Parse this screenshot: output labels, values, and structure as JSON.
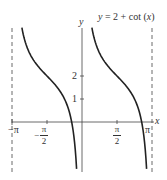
{
  "chart_data": {
    "type": "line",
    "title": "y = 2 + cot (x)",
    "xlabel": "x",
    "ylabel": "y",
    "function": "y = 2 + cot(x)",
    "xlim": [
      -3.1416,
      3.1416
    ],
    "ylim": [
      -2.1,
      4.1
    ],
    "grid": false,
    "legend": null,
    "x_ticks": [
      {
        "value": -3.1416,
        "label": "−π"
      },
      {
        "value": -1.5708,
        "label": "−π/2"
      },
      {
        "value": 1.5708,
        "label": "π/2"
      },
      {
        "value": 3.1416,
        "label": "π"
      }
    ],
    "y_ticks": [
      {
        "value": 1,
        "label": "1"
      },
      {
        "value": 2,
        "label": "2"
      }
    ],
    "asymptotes": [
      {
        "x": -3.1416,
        "style": "dashed"
      },
      {
        "x": 0,
        "style": "dashed (coincides with y-axis)"
      },
      {
        "x": 3.1416,
        "style": "dashed"
      }
    ],
    "series": [
      {
        "name": "branch (−π, 0)",
        "x": [
          -2.69,
          -2.36,
          -1.97,
          -1.5708,
          -1.18,
          -0.79,
          -0.46,
          -0.24
        ],
        "y": [
          4.0,
          3.0,
          2.41,
          2.0,
          1.59,
          1.0,
          0.0,
          -2.0
        ]
      },
      {
        "name": "branch (0, π)",
        "x": [
          0.46,
          0.79,
          1.18,
          1.5708,
          1.97,
          2.36,
          2.68,
          2.9
        ],
        "y": [
          4.0,
          3.0,
          2.41,
          2.0,
          1.59,
          1.0,
          0.0,
          -2.0
        ]
      }
    ]
  },
  "labels": {
    "title": "y = 2 + cot (x)",
    "x_axis": "x",
    "y_axis": "y",
    "tick_neg_pi": "−π",
    "tick_pi": "π",
    "tick_pi_sym": "π",
    "tick_two": "2",
    "minus": "−",
    "tick_y1": "1",
    "tick_y2": "2"
  }
}
